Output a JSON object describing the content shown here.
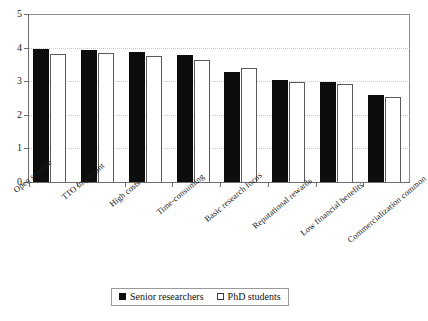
{
  "chart_data": {
    "type": "bar",
    "title": "",
    "subtitle": "",
    "xlabel": "",
    "ylabel": "",
    "ylim": [
      0,
      5
    ],
    "yticks": [
      0,
      1,
      2,
      3,
      4,
      5
    ],
    "ytick_labels": [
      "0",
      "1",
      "2",
      "3",
      "4",
      "5"
    ],
    "grid": true,
    "grid_axis": "y",
    "legend_position": "bottom-center",
    "categories": [
      "Open science",
      "TTO important",
      "High costs",
      "Time-consuming",
      "Basic research focus",
      "Reputational rewards",
      "Low financial benefits",
      "Commercialization common"
    ],
    "series": [
      {
        "name": "Senior researchers",
        "color": "#0d0d0d",
        "style": "filled",
        "values": [
          3.95,
          3.93,
          3.88,
          3.77,
          3.27,
          3.03,
          2.99,
          2.6
        ]
      },
      {
        "name": "PhD students",
        "color": "#ffffff",
        "style": "hollow",
        "values": [
          3.82,
          3.85,
          3.76,
          3.64,
          3.4,
          2.99,
          2.92,
          2.53
        ]
      }
    ]
  },
  "legend": {
    "entries": [
      {
        "label": "Senior researchers",
        "swatch": "filled-square-icon"
      },
      {
        "label": "PhD students",
        "swatch": "hollow-square-icon"
      }
    ]
  }
}
